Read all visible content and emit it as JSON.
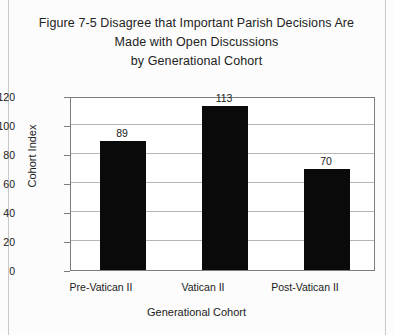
{
  "page": {
    "background_color": "#fcfcfc",
    "border_color": "#c9c9c9"
  },
  "title": {
    "line1": "Figure 7-5 Disagree that Important Parish Decisions Are",
    "line2": "Made with Open Discussions",
    "line3": "by Generational Cohort"
  },
  "chart_data": {
    "type": "bar",
    "title": "Figure 7-5 Disagree that Important Parish Decisions Are Made with Open Discussions by Generational Cohort",
    "categories": [
      "Pre-Vatican II",
      "Vatican II",
      "Post-Vatican II"
    ],
    "values": [
      89,
      113,
      70
    ],
    "value_labels": [
      "89",
      "113",
      "70"
    ],
    "xlabel": "Generational Cohort",
    "ylabel": "Cohort Index",
    "ylim": [
      0,
      120
    ],
    "ytick_labels": [
      "0",
      "20",
      "40",
      "60",
      "80",
      "100",
      "120"
    ],
    "ytick_values": [
      0,
      20,
      40,
      60,
      80,
      100,
      120
    ],
    "grid": "horizontal",
    "legend": "none",
    "bar_color": "#0a0a0a",
    "gridline_color": "#b6b6b6",
    "axis_color": "#7d7d7d"
  }
}
